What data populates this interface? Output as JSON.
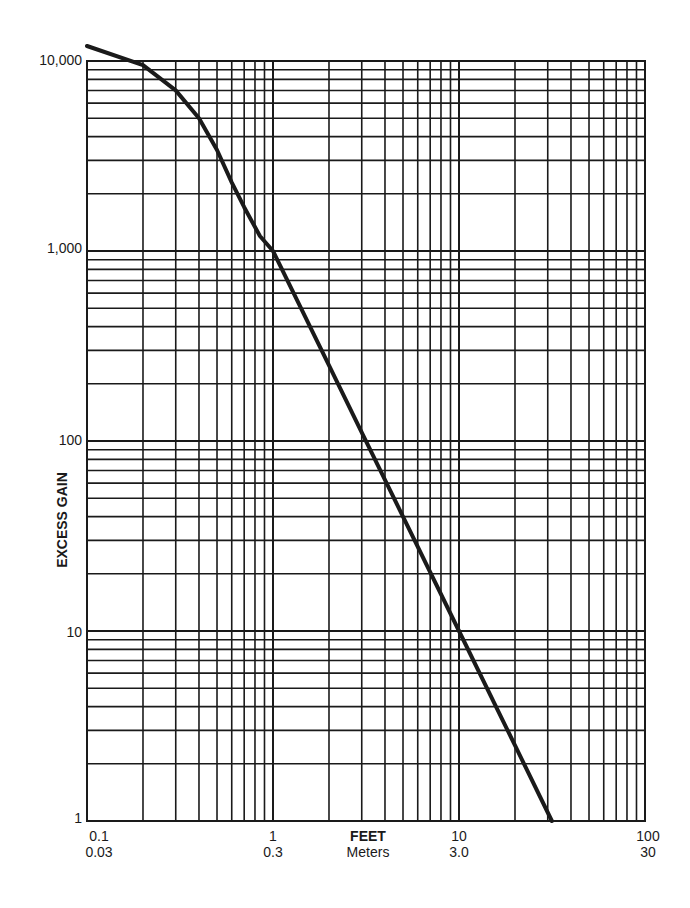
{
  "chart_data": {
    "type": "line",
    "title": "",
    "xlabel": "FEET",
    "xlabel_secondary": "Meters",
    "ylabel": "EXCESS GAIN",
    "x_scale": "log",
    "y_scale": "log",
    "xlim": [
      0.1,
      100
    ],
    "ylim": [
      1,
      10000
    ],
    "grid": true,
    "legend": null,
    "x_ticks": [
      {
        "value": 0.1,
        "label": "0.1",
        "label_secondary": "0.03"
      },
      {
        "value": 1,
        "label": "1",
        "label_secondary": "0.3"
      },
      {
        "value": 10,
        "label": "10",
        "label_secondary": "3.0"
      },
      {
        "value": 100,
        "label": "100",
        "label_secondary": "30"
      }
    ],
    "y_ticks": [
      {
        "value": 1,
        "label": "1"
      },
      {
        "value": 10,
        "label": "10"
      },
      {
        "value": 100,
        "label": "100"
      },
      {
        "value": 1000,
        "label": "1,000"
      },
      {
        "value": 10000,
        "label": "10,000"
      }
    ],
    "series": [
      {
        "name": "Excess gain vs distance",
        "x": [
          0.1,
          0.2,
          0.3,
          0.4,
          0.5,
          0.6,
          0.7,
          0.85,
          1,
          2,
          3,
          5,
          10,
          20,
          31.6
        ],
        "values": [
          12000,
          9500,
          7000,
          5000,
          3400,
          2300,
          1700,
          1200,
          1000,
          250,
          111,
          40,
          10,
          2.5,
          1
        ]
      }
    ]
  },
  "labels": {
    "y_axis_title": "EXCESS GAIN",
    "x_axis_title": "FEET",
    "x_axis_subtitle": "Meters",
    "y_ticks": [
      "1",
      "10",
      "100",
      "1,000",
      "10,000"
    ],
    "x_ticks_feet": [
      "0.1",
      "1",
      "10",
      "100"
    ],
    "x_ticks_meters": [
      "0.03",
      "0.3",
      "3.0",
      "30"
    ]
  }
}
